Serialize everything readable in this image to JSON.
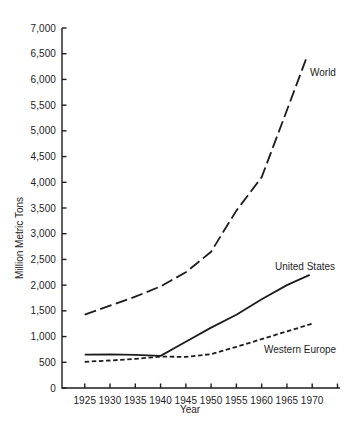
{
  "page": {
    "background": "#ffffff",
    "ink_color": "#1d1d1d"
  },
  "chart_data": {
    "type": "line",
    "title": "",
    "xlabel": "Year",
    "ylabel": "Million Metric Tons",
    "xlim": [
      1920.5,
      1975.5
    ],
    "ylim": [
      0,
      7000
    ],
    "grid": false,
    "legend_position": "inline-labels",
    "x_ticks": [
      1925,
      1930,
      1935,
      1940,
      1945,
      1950,
      1955,
      1960,
      1965,
      1970
    ],
    "x_axis_end_tick": 1975,
    "y_ticks": [
      0,
      500,
      1000,
      1500,
      2000,
      2500,
      3000,
      3500,
      4000,
      4500,
      5000,
      5500,
      6000,
      6500,
      7000
    ],
    "y_tick_format": "comma",
    "series": [
      {
        "name": "World",
        "line_style": "long-dash",
        "x": [
          1925,
          1930,
          1935,
          1940,
          1945,
          1950,
          1955,
          1960,
          1965,
          1969
        ],
        "values": [
          1425,
          1600,
          1775,
          1975,
          2250,
          2650,
          3450,
          4100,
          5400,
          6450
        ]
      },
      {
        "name": "United States",
        "line_style": "solid",
        "x": [
          1925,
          1930,
          1935,
          1940,
          1945,
          1950,
          1955,
          1960,
          1965,
          1969.5
        ],
        "values": [
          650,
          655,
          645,
          625,
          900,
          1175,
          1425,
          1725,
          2000,
          2200
        ]
      },
      {
        "name": "Western Europe",
        "line_style": "short-dash",
        "x": [
          1925,
          1930,
          1935,
          1940,
          1945,
          1950,
          1955,
          1960,
          1965,
          1970
        ],
        "values": [
          510,
          535,
          565,
          610,
          605,
          660,
          800,
          950,
          1100,
          1250
        ]
      }
    ]
  }
}
